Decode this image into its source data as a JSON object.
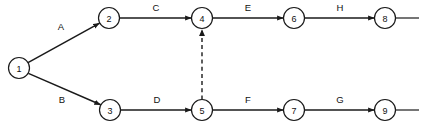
{
  "diagram": {
    "type": "activity-on-arrow-network",
    "background_color": "#ffffff",
    "stroke_color": "#1a1a1a",
    "text_color": "#111111",
    "nodes": [
      {
        "id": "1",
        "label": "1",
        "cx": 19,
        "cy": 68,
        "r": 10.5
      },
      {
        "id": "2",
        "label": "2",
        "cx": 109,
        "cy": 18,
        "r": 10.5
      },
      {
        "id": "3",
        "label": "3",
        "cx": 110,
        "cy": 110,
        "r": 10.5
      },
      {
        "id": "4",
        "label": "4",
        "cx": 202,
        "cy": 18,
        "r": 10.5
      },
      {
        "id": "5",
        "label": "5",
        "cx": 202,
        "cy": 110,
        "r": 10.5
      },
      {
        "id": "6",
        "label": "6",
        "cx": 294,
        "cy": 18,
        "r": 10.5
      },
      {
        "id": "7",
        "label": "7",
        "cx": 294,
        "cy": 110,
        "r": 10.5
      },
      {
        "id": "8",
        "label": "8",
        "cx": 385,
        "cy": 18,
        "r": 10.5
      },
      {
        "id": "9",
        "label": "9",
        "cx": 385,
        "cy": 110,
        "r": 10.5
      }
    ],
    "edges": [
      {
        "id": "edge-a",
        "label": "A",
        "from": "1",
        "to": "2",
        "style": "solid",
        "arrow": true,
        "x1": 28.0,
        "y1": 62.7,
        "x2": 99.6,
        "y2": 23.1,
        "label_x": 61,
        "label_y": 26
      },
      {
        "id": "edge-b",
        "label": "B",
        "from": "1",
        "to": "3",
        "style": "solid",
        "arrow": true,
        "x1": 28.4,
        "y1": 73.4,
        "x2": 100.7,
        "y2": 104.8,
        "label_x": 62,
        "label_y": 99
      },
      {
        "id": "edge-c",
        "label": "C",
        "from": "2",
        "to": "4",
        "style": "solid",
        "arrow": true,
        "x1": 119.5,
        "y1": 18,
        "x2": 191.5,
        "y2": 18,
        "label_x": 156,
        "label_y": 7
      },
      {
        "id": "edge-d",
        "label": "D",
        "from": "3",
        "to": "5",
        "style": "solid",
        "arrow": true,
        "x1": 120.5,
        "y1": 110,
        "x2": 191.5,
        "y2": 110,
        "label_x": 157,
        "label_y": 99
      },
      {
        "id": "edge-e",
        "label": "E",
        "from": "4",
        "to": "6",
        "style": "solid",
        "arrow": true,
        "x1": 212.5,
        "y1": 18,
        "x2": 283.5,
        "y2": 18,
        "label_x": 248,
        "label_y": 7
      },
      {
        "id": "edge-f",
        "label": "F",
        "from": "5",
        "to": "7",
        "style": "solid",
        "arrow": true,
        "x1": 212.5,
        "y1": 110,
        "x2": 283.5,
        "y2": 110,
        "label_x": 248,
        "label_y": 99
      },
      {
        "id": "edge-g",
        "label": "G",
        "from": "7",
        "to": "9",
        "style": "solid",
        "arrow": true,
        "x1": 304.5,
        "y1": 110,
        "x2": 374.5,
        "y2": 110,
        "label_x": 340,
        "label_y": 99
      },
      {
        "id": "edge-h",
        "label": "H",
        "from": "6",
        "to": "8",
        "style": "solid",
        "arrow": true,
        "x1": 304.5,
        "y1": 18,
        "x2": 374.5,
        "y2": 18,
        "label_x": 340,
        "label_y": 7
      },
      {
        "id": "edge-dummy",
        "label": "",
        "from": "5",
        "to": "4",
        "style": "dashed",
        "arrow": true,
        "x1": 202,
        "y1": 99.5,
        "x2": 202,
        "y2": 29.5,
        "label_x": 0,
        "label_y": 0
      }
    ],
    "tails": [
      {
        "id": "tail-from-8",
        "x1": 395.5,
        "y1": 18,
        "x2": 419,
        "y2": 18
      },
      {
        "id": "tail-from-9",
        "x1": 395.5,
        "y1": 110,
        "x2": 419,
        "y2": 110
      }
    ]
  }
}
